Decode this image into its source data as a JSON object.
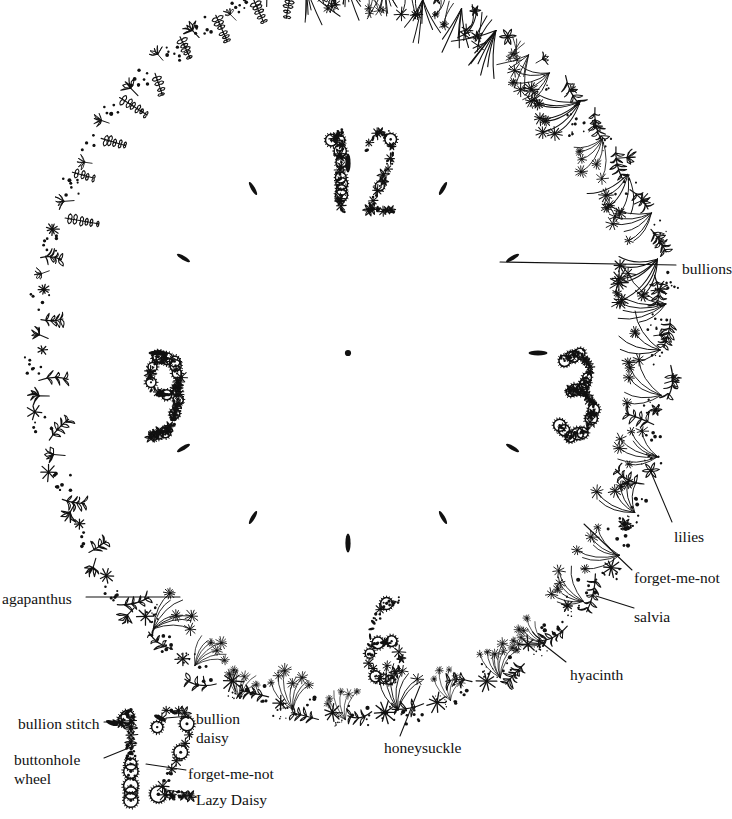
{
  "style": {
    "ink": "#111111",
    "paper": "#ffffff",
    "stroke_width": 1.25
  },
  "clock": {
    "center": {
      "x": 348,
      "y": 353
    },
    "center_dot_label": "center-dot",
    "numerals": [
      {
        "value": "12",
        "x": 330,
        "y": 130
      },
      {
        "value": "3",
        "x": 556,
        "y": 352
      },
      {
        "value": "6",
        "x": 363,
        "y": 598
      },
      {
        "value": "9",
        "x": 143,
        "y": 352
      }
    ],
    "hour_markers": {
      "stitch": "bullion",
      "count": 12,
      "hours": [
        12,
        1,
        2,
        3,
        4,
        5,
        6,
        7,
        8,
        9,
        10,
        11
      ]
    }
  },
  "callouts": [
    {
      "name": "bullions",
      "text": "bullions",
      "x": 682,
      "y": 260,
      "anchor": "left"
    },
    {
      "name": "lilies",
      "text": "lilies",
      "x": 674,
      "y": 528,
      "anchor": "left"
    },
    {
      "name": "forget-me-not",
      "text": "forget-me-not",
      "x": 634,
      "y": 569,
      "anchor": "left"
    },
    {
      "name": "salvia",
      "text": "salvia",
      "x": 634,
      "y": 608,
      "anchor": "left"
    },
    {
      "name": "hyacinth",
      "text": "hyacinth",
      "x": 570,
      "y": 666,
      "anchor": "left"
    },
    {
      "name": "honeysuckle",
      "text": "honeysuckle",
      "x": 384,
      "y": 739,
      "anchor": "left"
    },
    {
      "name": "agapanthus",
      "text": "agapanthus",
      "x": 2,
      "y": 590,
      "anchor": "right"
    }
  ],
  "detail_inset": {
    "numeral": "12",
    "callouts": [
      {
        "name": "bullion-stitch",
        "text": "bullion stitch",
        "x": 18,
        "y": 715,
        "wrap": false
      },
      {
        "name": "bullion-daisy",
        "text": "bullion\ndaisy",
        "x": 196,
        "y": 710,
        "wrap": true
      },
      {
        "name": "buttonhole-wheel",
        "text": "buttonhole\nwheel",
        "x": 14,
        "y": 751,
        "wrap": true
      },
      {
        "name": "forget-me-not",
        "text": "forget-me-not",
        "x": 188,
        "y": 765,
        "wrap": false
      },
      {
        "name": "lazy-daisy",
        "text": "Lazy Daisy",
        "x": 196,
        "y": 791,
        "wrap": false
      }
    ]
  }
}
